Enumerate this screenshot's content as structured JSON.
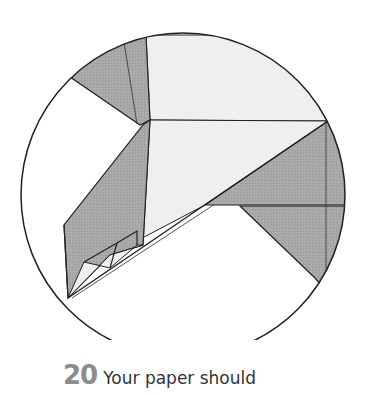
{
  "diagram": {
    "colors": {
      "shaded": "#a9a9a9",
      "light": "#efefef",
      "white": "#ffffff",
      "line": "#222222"
    }
  },
  "caption": {
    "step_number": "20",
    "text": "Your paper should"
  }
}
